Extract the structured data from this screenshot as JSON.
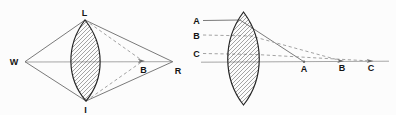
{
  "figure": {
    "colors": {
      "background": "#fcfcfc",
      "lens_outline": "#262626",
      "hatch_line": "#4a4a4a",
      "ray_line": "#6b6b6b",
      "dashed_line": "#999999",
      "axis_line": "#8f8f8f",
      "label_text": "#141414"
    },
    "left_panel": {
      "labels": {
        "lens_top": "L",
        "left_vertex": "W",
        "lens_bottom": "I",
        "inner_axis_point": "B",
        "right_vertex": "R"
      }
    },
    "right_panel": {
      "ray_labels": {
        "top": "A",
        "middle": "B",
        "bottom": "C"
      },
      "axis_points": {
        "near": "A",
        "middle": "B",
        "far": "C"
      }
    }
  }
}
